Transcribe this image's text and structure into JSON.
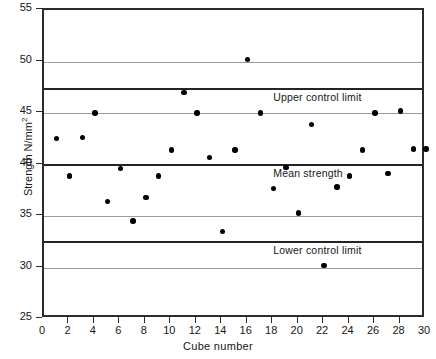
{
  "chart_data": {
    "type": "scatter",
    "title": "",
    "xlabel": "Cube number",
    "ylabel": "Strength N/mm",
    "ylabel_superscript": "2",
    "xlim": [
      0,
      30
    ],
    "ylim": [
      25,
      55
    ],
    "grid": true,
    "legend": "none",
    "xticks": [
      0,
      2,
      4,
      6,
      8,
      10,
      12,
      14,
      16,
      18,
      20,
      22,
      24,
      26,
      28,
      30
    ],
    "yticks": [
      25,
      30,
      35,
      40,
      45,
      50,
      55
    ],
    "x": [
      1,
      2,
      3,
      4,
      5,
      6,
      7,
      8,
      9,
      10,
      11,
      12,
      13,
      14,
      15,
      16,
      17,
      18,
      19,
      20,
      21,
      22,
      23,
      24,
      25,
      26,
      27,
      28,
      29,
      30
    ],
    "values": [
      42.5,
      38.9,
      42.6,
      45.0,
      36.4,
      39.6,
      34.5,
      36.8,
      38.9,
      41.4,
      47.0,
      45.0,
      40.7,
      33.5,
      41.4,
      50.2,
      45.0,
      37.7,
      39.7,
      35.3,
      43.9,
      30.2,
      37.8,
      38.9,
      41.4,
      45.0,
      39.1,
      45.2,
      41.5,
      41.5
    ],
    "reference_lines": [
      {
        "label": "Upper control limit",
        "value": 47.3,
        "style": "solid-dark",
        "label_x": 18.0
      },
      {
        "label": "Mean strength",
        "value": 40.0,
        "style": "solid-dark",
        "label_x": 18.0
      },
      {
        "label": "Lower control limit",
        "value": 32.5,
        "style": "solid-dark",
        "label_x": 18.0
      }
    ]
  },
  "caption": ""
}
